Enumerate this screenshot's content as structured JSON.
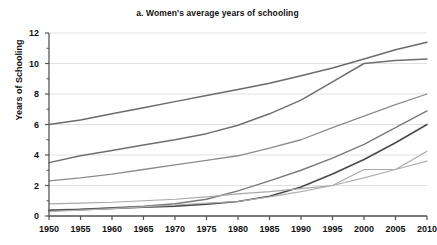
{
  "chart_data": {
    "type": "line",
    "title": "a. Women's average years of schooling",
    "xlabel": "",
    "ylabel": "Years of Schooling",
    "xlim": [
      1950,
      2010
    ],
    "ylim": [
      0,
      12
    ],
    "ytick_step": 2,
    "xtick_step": 5,
    "grid": true,
    "legend": "none",
    "x": [
      1950,
      1955,
      1960,
      1965,
      1970,
      1975,
      1980,
      1985,
      1990,
      1995,
      2000,
      2005,
      2010
    ],
    "xticklabels": [
      "1950",
      "1955",
      "1960",
      "1965",
      "1970",
      "1975",
      "1980",
      "1985",
      "1990",
      "1995",
      "2000",
      "2005",
      "2010"
    ],
    "yticklabels": [
      "0",
      "2",
      "4",
      "6",
      "8",
      "10",
      "12"
    ],
    "yticks": [
      0,
      2,
      4,
      6,
      8,
      10,
      12
    ],
    "series": [
      {
        "name": "series-1",
        "color": "#6b6b6b",
        "width": 1.5,
        "values": [
          6.0,
          6.3,
          6.7,
          7.1,
          7.5,
          7.9,
          8.3,
          8.7,
          9.2,
          9.7,
          10.3,
          10.9,
          11.4
        ]
      },
      {
        "name": "series-2",
        "color": "#6f6f6f",
        "width": 1.5,
        "values": [
          3.5,
          3.95,
          4.3,
          4.65,
          5.0,
          5.4,
          5.95,
          6.7,
          7.6,
          8.8,
          10.0,
          10.2,
          10.3
        ]
      },
      {
        "name": "series-3",
        "color": "#8c8c8c",
        "width": 1.3,
        "values": [
          2.3,
          2.5,
          2.75,
          3.05,
          3.35,
          3.65,
          3.95,
          4.45,
          5.0,
          5.8,
          6.55,
          7.3,
          8.0
        ]
      },
      {
        "name": "series-4",
        "color": "#7a7a7a",
        "width": 1.4,
        "values": [
          0.4,
          0.45,
          0.55,
          0.65,
          0.8,
          1.1,
          1.65,
          2.3,
          3.0,
          3.8,
          4.7,
          5.8,
          6.9
        ]
      },
      {
        "name": "series-5",
        "color": "#4a4a4a",
        "width": 1.6,
        "values": [
          0.35,
          0.42,
          0.5,
          0.58,
          0.65,
          0.78,
          0.95,
          1.3,
          1.9,
          2.75,
          3.7,
          4.8,
          6.0
        ]
      },
      {
        "name": "series-6",
        "color": "#a8a8a8",
        "width": 1.2,
        "values": [
          0.8,
          0.85,
          0.9,
          1.0,
          1.1,
          1.25,
          1.45,
          1.6,
          1.8,
          2.0,
          3.05,
          3.05,
          4.25
        ]
      },
      {
        "name": "series-7",
        "color": "#b0b0b0",
        "width": 1.2,
        "values": [
          0.3,
          0.38,
          0.48,
          0.6,
          0.72,
          0.85,
          0.95,
          1.25,
          1.6,
          2.0,
          2.5,
          3.05,
          3.6
        ]
      }
    ]
  },
  "colors": {
    "axis": "#555555",
    "grid": "#d9d9d9",
    "text": "#111111",
    "background": "#ffffff"
  }
}
